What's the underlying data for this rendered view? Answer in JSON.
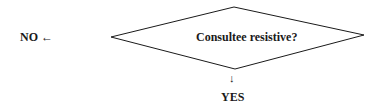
{
  "diagram": {
    "type": "flowchart-decision",
    "decision": {
      "shape": "diamond",
      "label": "Consultee resistive?",
      "vertices": {
        "left": [
          111,
          37
        ],
        "top": [
          234,
          7
        ],
        "right": [
          364,
          35
        ],
        "bottom": [
          235,
          69
        ]
      }
    },
    "branches": [
      {
        "label": "NO",
        "arrow": "←",
        "direction": "left"
      },
      {
        "label": "YES",
        "arrow": "↓",
        "direction": "down"
      }
    ],
    "colors": {
      "stroke": "#1a1a1a",
      "background": "#ffffff"
    }
  }
}
